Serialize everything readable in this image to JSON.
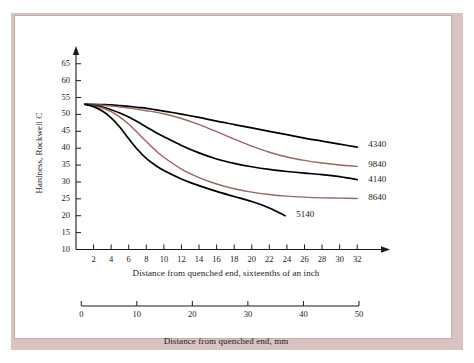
{
  "figure": {
    "frame_color": "#d9c3c0",
    "sheet_color": "#ffffff"
  },
  "chart_data": {
    "type": "line",
    "title": "",
    "xlabel": "Distance from quenched end, sixteenths of an inch",
    "xlabel_secondary": "Distance from quenched end, mm",
    "ylabel": "Hardness, Rockwell C",
    "xlim": [
      0,
      33
    ],
    "ylim": [
      10,
      67
    ],
    "xticks": [
      2,
      4,
      6,
      8,
      10,
      12,
      14,
      16,
      18,
      20,
      22,
      24,
      26,
      28,
      30,
      32
    ],
    "xticks_secondary": [
      0,
      10,
      20,
      30,
      40,
      50
    ],
    "yticks": [
      10,
      15,
      20,
      25,
      30,
      35,
      40,
      45,
      50,
      55,
      60,
      65
    ],
    "grid": false,
    "legend_position": "right-inline-labels",
    "series": [
      {
        "name": "4340",
        "color": "#000000",
        "label_x": 32.8,
        "label_y": 41.0,
        "x": [
          1,
          2,
          3,
          4,
          5,
          6,
          7,
          8,
          9,
          10,
          12,
          14,
          16,
          18,
          20,
          22,
          24,
          26,
          28,
          30,
          32
        ],
        "y": [
          53,
          53,
          52.9,
          52.8,
          52.6,
          52.4,
          52.1,
          51.8,
          51.4,
          51.0,
          50.1,
          49.1,
          48.0,
          47.0,
          46.0,
          45.0,
          44.0,
          43.0,
          42.1,
          41.2,
          40.3
        ]
      },
      {
        "name": "9840",
        "color": "#9e6460",
        "label_x": 32.8,
        "label_y": 35.0,
        "x": [
          1,
          2,
          3,
          4,
          5,
          6,
          7,
          8,
          9,
          10,
          12,
          14,
          16,
          18,
          20,
          22,
          24,
          26,
          28,
          30,
          32
        ],
        "y": [
          53,
          52.9,
          52.7,
          52.5,
          52.2,
          51.9,
          51.5,
          51.1,
          50.7,
          50.2,
          48.8,
          47.0,
          44.9,
          42.7,
          40.6,
          38.8,
          37.4,
          36.4,
          35.6,
          35.0,
          34.6
        ]
      },
      {
        "name": "4140",
        "color": "#000000",
        "label_x": 32.8,
        "label_y": 30.5,
        "x": [
          1,
          2,
          3,
          4,
          5,
          6,
          7,
          8,
          9,
          10,
          12,
          14,
          16,
          18,
          20,
          22,
          24,
          26,
          28,
          30,
          32
        ],
        "y": [
          53,
          52.7,
          52.2,
          51.4,
          50.4,
          49.2,
          47.8,
          46.3,
          44.8,
          43.4,
          40.8,
          38.6,
          36.8,
          35.5,
          34.5,
          33.7,
          33.1,
          32.6,
          32.2,
          31.6,
          30.7
        ]
      },
      {
        "name": "8640",
        "color": "#9e6460",
        "label_x": 32.8,
        "label_y": 25.2,
        "x": [
          1,
          2,
          3,
          4,
          5,
          6,
          7,
          8,
          9,
          10,
          12,
          14,
          16,
          18,
          20,
          22,
          24,
          26,
          28,
          30,
          32
        ],
        "y": [
          53,
          52.6,
          51.9,
          50.8,
          49.2,
          47.1,
          44.6,
          42.0,
          39.5,
          37.3,
          33.8,
          31.3,
          29.4,
          28.0,
          27.0,
          26.3,
          25.8,
          25.5,
          25.3,
          25.2,
          25.1
        ]
      },
      {
        "name": "5140",
        "color": "#000000",
        "label_x": 24.6,
        "label_y": 20.3,
        "x": [
          1,
          2,
          3,
          4,
          5,
          6,
          7,
          8,
          9,
          10,
          12,
          14,
          16,
          18,
          20,
          22,
          23.8
        ],
        "y": [
          53,
          52.3,
          51.0,
          49.0,
          46.2,
          42.8,
          39.6,
          37.0,
          35.0,
          33.4,
          30.9,
          28.9,
          27.2,
          25.7,
          24.2,
          22.3,
          20.0
        ]
      }
    ]
  }
}
